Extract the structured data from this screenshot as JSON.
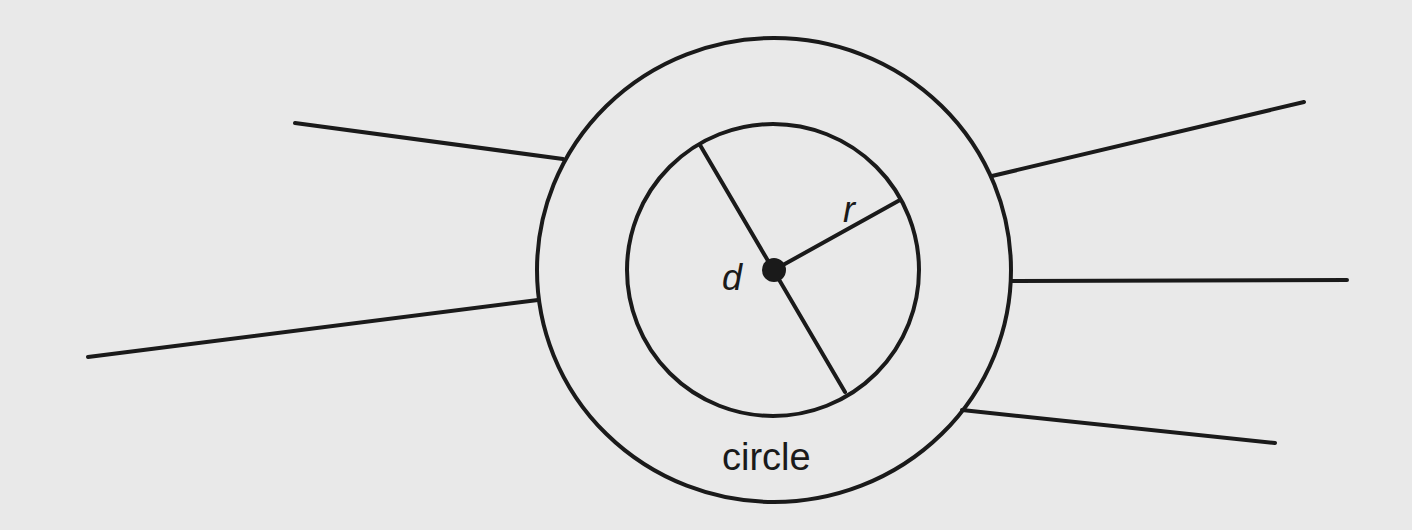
{
  "diagram": {
    "background": "#e9e9e9",
    "stroke_color": "#1a1a1a",
    "outer_circle": {
      "cx": 774,
      "cy": 270,
      "rx": 237,
      "ry": 232,
      "label": "circle"
    },
    "inner_circle": {
      "cx": 773,
      "cy": 270,
      "r": 146
    },
    "center_dot": {
      "cx": 774,
      "cy": 270,
      "r": 12
    },
    "diameter": {
      "x1": 700,
      "y1": 145,
      "x2": 845,
      "y2": 392,
      "label": "d"
    },
    "radius": {
      "x1": 774,
      "y1": 270,
      "x2": 900,
      "y2": 200,
      "label": "r"
    },
    "spokes": [
      {
        "x1": 295,
        "y1": 123,
        "x2": 563,
        "y2": 159
      },
      {
        "x1": 88,
        "y1": 357,
        "x2": 538,
        "y2": 300
      },
      {
        "x1": 992,
        "y1": 176,
        "x2": 1304,
        "y2": 102
      },
      {
        "x1": 1012,
        "y1": 281,
        "x2": 1347,
        "y2": 280
      },
      {
        "x1": 962,
        "y1": 410,
        "x2": 1275,
        "y2": 443
      }
    ]
  }
}
